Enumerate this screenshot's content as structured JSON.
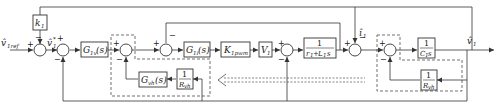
{
  "diagram": {
    "type": "control-block-diagram",
    "signals": {
      "input": "v̂1ref",
      "ref_inner": "v̂1*",
      "current": "î1",
      "output": "v̂1"
    },
    "blocks": {
      "k1": {
        "main": "k",
        "sub": "1"
      },
      "g1v": {
        "main": "G",
        "sub": "1v",
        "suffix": "(s)"
      },
      "g1i": {
        "main": "G",
        "sub": "1i",
        "suffix": "(s)"
      },
      "kpwm": {
        "main": "K",
        "sub": "1pwm"
      },
      "v1": {
        "main": "V",
        "sub": "1"
      },
      "plant_l": {
        "num": "1",
        "den_a": "r",
        "den_a_sub": "1",
        "den_plus": "+",
        "den_b": "L",
        "den_b_sub": "1",
        "den_s": "s"
      },
      "cap": {
        "num": "1",
        "den": "C",
        "den_sub": "1",
        "den_s": "s"
      },
      "gvh": {
        "main": "G",
        "sub": "vh",
        "suffix": "(s)"
      },
      "rvh_left": {
        "num": "1",
        "den": "R",
        "den_sub": "vh"
      },
      "rvh_right": {
        "num": "1",
        "den": "R",
        "den_sub": "vh"
      }
    },
    "signs": {
      "plus": "+",
      "minus": "−"
    }
  }
}
